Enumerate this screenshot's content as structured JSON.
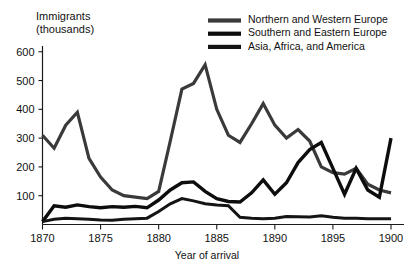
{
  "chart_data": {
    "type": "line",
    "title": "",
    "xlabel": "Year of arrival",
    "ylabel": "Immigrants\n(thousands)",
    "ylabel_line1": "Immigrants",
    "ylabel_line2": "(thousands)",
    "xlim": [
      1870,
      1900
    ],
    "ylim": [
      0,
      620
    ],
    "ytick_labels": [
      "600",
      "500",
      "400",
      "300",
      "200",
      "100"
    ],
    "ytick_values": [
      600,
      500,
      400,
      300,
      200,
      100
    ],
    "xtick_labels": [
      "1870",
      "1875",
      "1880",
      "1885",
      "1890",
      "1895",
      "1900"
    ],
    "xtick_values": [
      1870,
      1875,
      1880,
      1885,
      1890,
      1895,
      1900
    ],
    "grid": false,
    "legend_position": "top-right",
    "x": [
      1870,
      1871,
      1872,
      1873,
      1874,
      1875,
      1876,
      1877,
      1878,
      1879,
      1880,
      1881,
      1882,
      1883,
      1884,
      1885,
      1886,
      1887,
      1888,
      1889,
      1890,
      1891,
      1892,
      1893,
      1894,
      1895,
      1896,
      1897,
      1898,
      1899,
      1900
    ],
    "series": [
      {
        "name": "Northern and Western Europe",
        "color": "#3a3a3a",
        "stroke_width": 3.2,
        "values": [
          310,
          265,
          345,
          390,
          230,
          165,
          120,
          100,
          95,
          90,
          115,
          290,
          470,
          490,
          555,
          400,
          310,
          285,
          350,
          420,
          345,
          300,
          330,
          290,
          200,
          180,
          175,
          195,
          140,
          120,
          110
        ]
      },
      {
        "name": "Southern and Eastern Europe",
        "color": "#0d0d0d",
        "stroke_width": 3.4,
        "values": [
          10,
          65,
          60,
          68,
          62,
          58,
          62,
          60,
          63,
          58,
          85,
          120,
          145,
          148,
          115,
          90,
          80,
          78,
          110,
          155,
          105,
          145,
          215,
          260,
          285,
          195,
          105,
          195,
          120,
          95,
          300
        ]
      },
      {
        "name": "Asia, Africa, and America",
        "color": "#141414",
        "stroke_width": 3.0,
        "values": [
          10,
          18,
          22,
          20,
          18,
          16,
          15,
          18,
          20,
          22,
          45,
          72,
          90,
          82,
          72,
          68,
          65,
          25,
          22,
          20,
          22,
          28,
          27,
          26,
          30,
          25,
          22,
          22,
          20,
          20,
          20
        ]
      }
    ]
  },
  "legend": {
    "items": [
      {
        "label": "Northern and Western Europe",
        "swatch_color": "#3a3a3a"
      },
      {
        "label": "Southern and Eastern Europe",
        "swatch_color": "#0d0d0d"
      },
      {
        "label": "Asia, Africa, and America",
        "swatch_color": "#141414"
      }
    ]
  }
}
